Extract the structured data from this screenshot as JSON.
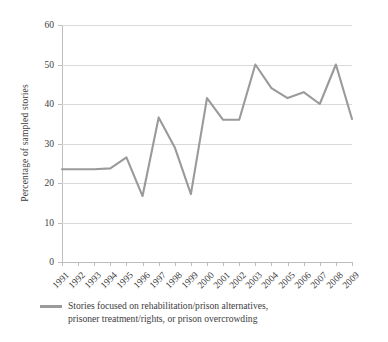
{
  "chart_data": {
    "type": "line",
    "title": "",
    "xlabel": "",
    "ylabel": "Percentage of sampled stories",
    "ylim": [
      0,
      60
    ],
    "ytick_values": [
      0,
      10,
      20,
      30,
      40,
      50,
      60
    ],
    "ytick_labels": [
      "0",
      "10",
      "20",
      "30",
      "40",
      "50",
      "60"
    ],
    "grid": "horizontal",
    "legend_position": "bottom-left",
    "categories": [
      "1991",
      "1992",
      "1993",
      "1994",
      "1995",
      "1996",
      "1997",
      "1998",
      "1999",
      "2000",
      "2001",
      "2002",
      "2003",
      "2004",
      "2005",
      "2006",
      "2007",
      "2008",
      "2009"
    ],
    "series": [
      {
        "name": "Stories focused on rehabilitation/prison alternatives, prisoner treatment/rights, or prison overcrowding",
        "color": "#9a9a9a",
        "values": [
          23.5,
          23.5,
          23.5,
          23.7,
          26.5,
          16.7,
          36.6,
          29.0,
          17.2,
          41.5,
          36.0,
          36.0,
          50.0,
          44.0,
          41.5,
          43.0,
          40.0,
          50.0,
          36.2
        ]
      }
    ]
  },
  "legend": {
    "line1": "Stories focused on rehabilitation/prison alternatives,",
    "line2": "prisoner treatment/rights, or prison overcrowding",
    "full": "Stories focused on rehabilitation/prison alternatives, prisoner treatment/rights, or prison overcrowding"
  },
  "axes": {
    "y_title": "Percentage of sampled stories"
  }
}
